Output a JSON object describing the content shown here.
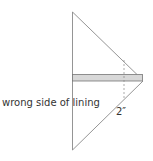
{
  "diagram": {
    "labels": {
      "lining": "wrong side of lining",
      "measurement": "2″"
    },
    "colors": {
      "line": "#7a7a7a",
      "strip_fill": "#d8d8d8",
      "strip_stroke": "#777777",
      "dash": "#888888"
    }
  }
}
